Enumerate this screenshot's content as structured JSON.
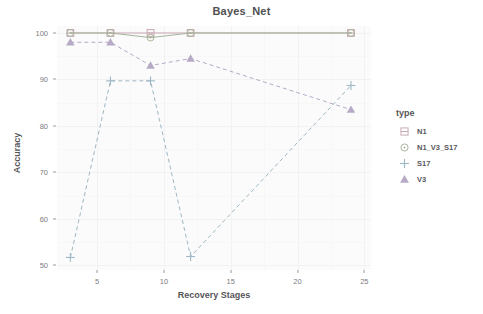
{
  "chart_data": {
    "type": "line",
    "title": "Bayes_Net",
    "xlabel": "Recovery Stages",
    "ylabel": "Accuracy",
    "legend_title": "type",
    "legend_position": "right",
    "grid": true,
    "xlim": [
      2.0,
      25.5
    ],
    "ylim": [
      49.0,
      101.5
    ],
    "xticks": [
      5,
      10,
      15,
      20,
      25
    ],
    "yticks": [
      50,
      60,
      70,
      80,
      90,
      100
    ],
    "x": [
      3,
      6,
      9,
      12,
      24
    ],
    "series": [
      {
        "name": "N1",
        "values": [
          100,
          100,
          100,
          100,
          100
        ],
        "color": "#c9a9b4",
        "marker": "square-line",
        "linetype": "solid"
      },
      {
        "name": "N1_V3_S17",
        "values": [
          100,
          100,
          99,
          100,
          100
        ],
        "color": "#a7b49a",
        "marker": "circle-dot",
        "linetype": "solid"
      },
      {
        "name": "S17",
        "values": [
          51.7,
          89.7,
          89.7,
          51.9,
          88.7
        ],
        "color": "#9db7c4",
        "marker": "plus",
        "linetype": "dashed"
      },
      {
        "name": "V3",
        "values": [
          98.0,
          98.0,
          93.0,
          94.5,
          83.5
        ],
        "color": "#b6aac6",
        "marker": "triangle",
        "linetype": "dashed"
      }
    ]
  },
  "legend": {
    "title": "type",
    "items": [
      {
        "label": "N1",
        "icon": "square-line-marker-icon"
      },
      {
        "label": "N1_V3_S17",
        "icon": "circle-dot-marker-icon"
      },
      {
        "label": "S17",
        "icon": "plus-marker-icon"
      },
      {
        "label": "V3",
        "icon": "triangle-marker-icon"
      }
    ]
  },
  "axes": {
    "x_title": "Recovery Stages",
    "y_title": "Accuracy",
    "x_tick_labels": [
      "5",
      "10",
      "15",
      "20",
      "25"
    ],
    "y_tick_labels": [
      "100",
      "90",
      "80",
      "70",
      "60",
      "50"
    ]
  },
  "header": {
    "title": "Bayes_Net"
  }
}
